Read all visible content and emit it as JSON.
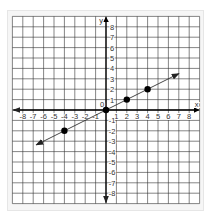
{
  "chart_data": {
    "type": "line",
    "title": "",
    "xlabel": "x",
    "ylabel": "y",
    "xlim": [
      -9,
      9
    ],
    "ylim": [
      -9,
      9
    ],
    "grid": true,
    "x_ticks": [
      -8,
      -7,
      -6,
      -5,
      -4,
      -3,
      -2,
      -1,
      1,
      2,
      3,
      4,
      5,
      6,
      7,
      8
    ],
    "y_ticks": [
      -8,
      -7,
      -6,
      -5,
      -4,
      -3,
      -2,
      -1,
      1,
      2,
      3,
      4,
      5,
      6,
      7,
      8
    ],
    "origin_label": "0",
    "series": [
      {
        "name": "line",
        "equation": "y = 0.5x",
        "arrow_start": [
          -6.7,
          -3.35
        ],
        "arrow_end": [
          7.0,
          3.5
        ],
        "points": [
          [
            -4,
            -2
          ],
          [
            0,
            0
          ],
          [
            2,
            1
          ],
          [
            4,
            2
          ]
        ]
      }
    ],
    "colors": {
      "grid": "#333333",
      "axis": "#000000",
      "line": "#333333",
      "point": "#000000",
      "background": "#ffffff",
      "frame": "#f6f6f6"
    }
  }
}
